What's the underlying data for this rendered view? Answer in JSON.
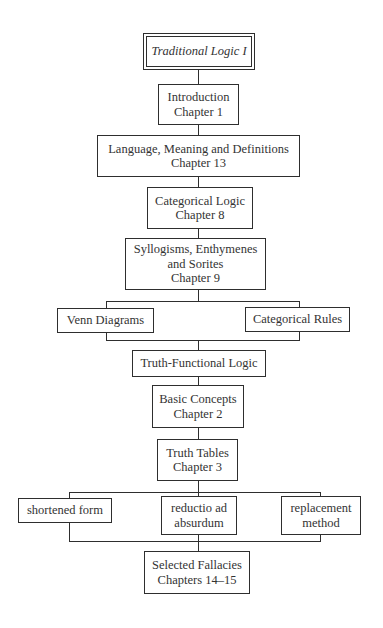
{
  "diagram": {
    "title": "Traditional Logic I",
    "nodes": {
      "introduction": {
        "line1": "Introduction",
        "line2": "Chapter 1"
      },
      "language": {
        "line1": "Language, Meaning and Definitions",
        "line2": "Chapter 13"
      },
      "categorical_logic": {
        "line1": "Categorical Logic",
        "line2": "Chapter 8"
      },
      "syllogisms": {
        "line1": "Syllogisms, Enthymenes",
        "line2": "and Sorites",
        "line3": "Chapter 9"
      },
      "venn_diagrams": {
        "line1": "Venn Diagrams"
      },
      "categorical_rules": {
        "line1": "Categorical Rules"
      },
      "truth_functional": {
        "line1": "Truth-Functional Logic"
      },
      "basic_concepts": {
        "line1": "Basic Concepts",
        "line2": "Chapter 2"
      },
      "truth_tables": {
        "line1": "Truth Tables",
        "line2": "Chapter 3"
      },
      "shortened_form": {
        "line1": "shortened form"
      },
      "reductio": {
        "line1": "reductio ad",
        "line2": "absurdum"
      },
      "replacement": {
        "line1": "replacement",
        "line2": "method"
      },
      "fallacies": {
        "line1": "Selected Fallacies",
        "line2": "Chapters 14–15"
      }
    },
    "edges": [
      [
        "title",
        "introduction"
      ],
      [
        "introduction",
        "language"
      ],
      [
        "language",
        "categorical_logic"
      ],
      [
        "categorical_logic",
        "syllogisms"
      ],
      [
        "syllogisms",
        "venn_diagrams"
      ],
      [
        "syllogisms",
        "categorical_rules"
      ],
      [
        "venn_diagrams",
        "truth_functional"
      ],
      [
        "categorical_rules",
        "truth_functional"
      ],
      [
        "truth_functional",
        "basic_concepts"
      ],
      [
        "basic_concepts",
        "truth_tables"
      ],
      [
        "truth_tables",
        "shortened_form"
      ],
      [
        "truth_tables",
        "reductio"
      ],
      [
        "truth_tables",
        "replacement"
      ],
      [
        "shortened_form",
        "fallacies"
      ],
      [
        "reductio",
        "fallacies"
      ],
      [
        "replacement",
        "fallacies"
      ]
    ]
  }
}
